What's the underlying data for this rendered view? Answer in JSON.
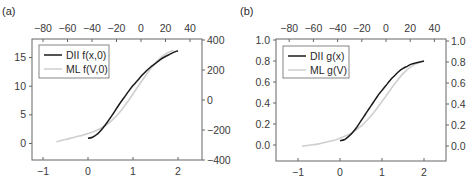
{
  "chart_data": [
    {
      "type": "line",
      "panel": "(a)",
      "title": "",
      "xlabel": "",
      "ylabel": "",
      "xlim": [
        -1.25,
        2.55
      ],
      "ylim": [
        -2.9,
        18.0
      ],
      "x_ticks": [
        -1,
        0,
        1,
        2
      ],
      "y_ticks": [
        0,
        5,
        10,
        15
      ],
      "top_x_ticks": [
        -80,
        -60,
        -40,
        -20,
        0,
        20,
        40
      ],
      "right_y_ticks": [
        -400,
        -200,
        0,
        200,
        400
      ],
      "grid": false,
      "legend_position": "upper left",
      "series": [
        {
          "name": "DII f(x,0)",
          "color": "#1a1a1a",
          "x": [
            0.0,
            0.1,
            0.2,
            0.3,
            0.4,
            0.5,
            0.6,
            0.7,
            0.8,
            0.9,
            1.0,
            1.1,
            1.2,
            1.3,
            1.4,
            1.5,
            1.6,
            1.7,
            1.8,
            1.9,
            2.0
          ],
          "y": [
            0.9,
            1.1,
            1.6,
            2.4,
            3.4,
            4.5,
            5.7,
            6.9,
            8.0,
            9.1,
            10.1,
            11.0,
            11.9,
            12.7,
            13.4,
            14.0,
            14.6,
            15.1,
            15.5,
            15.9,
            16.2
          ]
        },
        {
          "name": "ML f(V,0)",
          "color": "#cfcfcf",
          "x": [
            -0.7,
            -0.5,
            -0.3,
            -0.1,
            0.1,
            0.3,
            0.5,
            0.7,
            0.9,
            1.1,
            1.3,
            1.5,
            1.7,
            1.9
          ],
          "y": [
            0.3,
            0.7,
            1.1,
            1.5,
            2.0,
            2.7,
            3.8,
            5.4,
            7.5,
            9.8,
            12.1,
            14.1,
            15.5,
            16.3
          ]
        }
      ]
    },
    {
      "type": "line",
      "panel": "(b)",
      "title": "",
      "xlabel": "",
      "ylabel": "",
      "xlim": [
        -1.5,
        2.5
      ],
      "ylim": [
        -0.15,
        1.0
      ],
      "x_ticks": [
        -1,
        0,
        1,
        2
      ],
      "y_ticks": [
        0.0,
        0.2,
        0.4,
        0.6,
        0.8,
        1.0
      ],
      "top_x_ticks": [
        -80,
        -60,
        -40,
        -20,
        0,
        20,
        40
      ],
      "right_y_ticks": [
        0.0,
        0.2,
        0.4,
        0.6,
        0.8,
        1.0
      ],
      "grid": false,
      "legend_position": "upper left",
      "series": [
        {
          "name": "DII g(x)",
          "color": "#1a1a1a",
          "x": [
            0.0,
            0.1,
            0.2,
            0.3,
            0.4,
            0.5,
            0.6,
            0.7,
            0.8,
            0.9,
            1.0,
            1.1,
            1.2,
            1.3,
            1.4,
            1.5,
            1.6,
            1.7,
            1.8,
            1.9,
            2.0
          ],
          "y": [
            0.04,
            0.05,
            0.08,
            0.12,
            0.17,
            0.23,
            0.29,
            0.35,
            0.41,
            0.47,
            0.52,
            0.57,
            0.62,
            0.66,
            0.7,
            0.73,
            0.75,
            0.77,
            0.78,
            0.79,
            0.8
          ]
        },
        {
          "name": "ML g(V)",
          "color": "#cfcfcf",
          "x": [
            -0.9,
            -0.7,
            -0.5,
            -0.3,
            -0.1,
            0.1,
            0.3,
            0.5,
            0.7,
            0.9,
            1.1,
            1.3,
            1.5,
            1.7,
            1.9
          ],
          "y": [
            -0.01,
            0.0,
            0.01,
            0.03,
            0.05,
            0.08,
            0.12,
            0.18,
            0.26,
            0.36,
            0.47,
            0.58,
            0.68,
            0.75,
            0.79
          ]
        }
      ]
    }
  ],
  "panels": {
    "a": {
      "label": "(a)",
      "legend": [
        "DII f(x,0)",
        "ML f(V,0)"
      ]
    },
    "b": {
      "label": "(b)",
      "legend": [
        "DII g(x)",
        "ML g(V)"
      ]
    }
  },
  "colors": {
    "dark_line": "#1a1a1a",
    "light_line": "#cfcfcf",
    "axis": "#555555"
  }
}
